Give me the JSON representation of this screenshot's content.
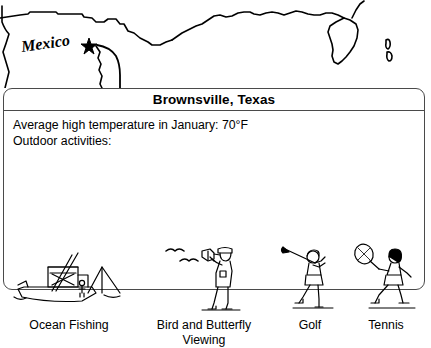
{
  "map": {
    "region_label": "Mexico",
    "marker_name": "star-marker",
    "features": [
      "us-mexico-border",
      "gulf-coastline",
      "florida-peninsula",
      "bahamas-islands"
    ]
  },
  "card": {
    "title": "Brownsville, Texas",
    "temperature_line": "Average high temperature in January: 70°F",
    "activities_heading": "Outdoor activities:",
    "activities": [
      {
        "label": "Ocean Fishing",
        "icon": "fishing-boat-icon"
      },
      {
        "label": "Bird and Butterfly\nViewing",
        "icon": "birdwatcher-icon"
      },
      {
        "label": "Golf",
        "icon": "golfer-icon"
      },
      {
        "label": "Tennis",
        "icon": "tennis-player-icon"
      }
    ]
  },
  "colors": {
    "ink": "#000000",
    "border": "#4a4a4a",
    "background": "#ffffff"
  }
}
